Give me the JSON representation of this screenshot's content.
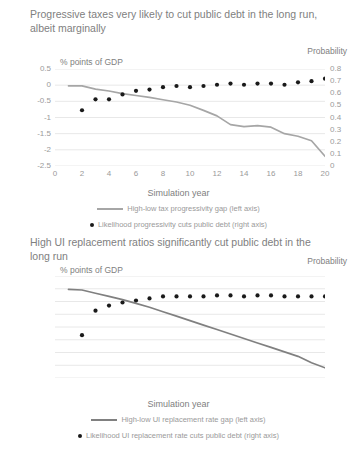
{
  "panels": [
    {
      "title": "Progressive taxes very likely to cut public debt in the long run, albeit marginally",
      "left_axis_caption": "% points of GDP",
      "right_axis_caption": "Probability",
      "xlabel": "Simulation year",
      "legend": [
        {
          "marker": "line",
          "label": "High-low tax progressivity gap (left axis)"
        },
        {
          "marker": "dot",
          "label": "Likelihood progressivity cuts public debt (right axis)"
        }
      ],
      "chart_data": {
        "type": "line",
        "title": "Progressive taxes very likely to cut public debt in the long run, albeit marginally",
        "xlabel": "Simulation year",
        "ylabel": "% points of GDP",
        "y2label": "Probability",
        "xlim": [
          0,
          20
        ],
        "ylim": [
          -2.5,
          0.5
        ],
        "y2lim": [
          0,
          0.8
        ],
        "xticks": [
          0,
          2,
          4,
          6,
          8,
          10,
          12,
          14,
          16,
          18,
          20
        ],
        "yticks": [
          0.5,
          0,
          -0.5,
          -1,
          -1.5,
          -2,
          -2.5
        ],
        "y2ticks": [
          0.8,
          0.7,
          0.6,
          0.5,
          0.4,
          0.3,
          0.2,
          0.1,
          0
        ],
        "grid": true,
        "legend_position": "bottom",
        "x": [
          1,
          2,
          3,
          4,
          5,
          6,
          7,
          8,
          9,
          10,
          11,
          12,
          13,
          14,
          15,
          16,
          17,
          18,
          19,
          20
        ],
        "series": [
          {
            "name": "High-low tax progressivity gap (left axis)",
            "type": "line",
            "axis": "left",
            "color": "#a6a6a6",
            "values": [
              -0.02,
              -0.02,
              -0.12,
              -0.18,
              -0.26,
              -0.32,
              -0.38,
              -0.45,
              -0.52,
              -0.62,
              -0.78,
              -0.95,
              -1.22,
              -1.28,
              -1.25,
              -1.3,
              -1.5,
              -1.58,
              -1.72,
              -2.2
            ]
          },
          {
            "name": "Likelihood progressivity cuts public debt (right axis)",
            "type": "scatter",
            "axis": "right",
            "color": "#1a1a1a",
            "values": [
              null,
              0.46,
              0.55,
              0.55,
              0.59,
              0.62,
              0.63,
              0.65,
              0.66,
              0.65,
              0.66,
              0.67,
              0.68,
              0.67,
              0.68,
              0.68,
              0.67,
              0.69,
              0.7,
              0.72
            ]
          }
        ]
      }
    },
    {
      "title": "High UI replacement ratios significantly cut public debt in the long run",
      "left_axis_caption": "% points of GDP",
      "right_axis_caption": "Probability",
      "xlabel": "Simulation year",
      "legend": [
        {
          "marker": "line",
          "label": "High-low UI replacement rate gap (left axis)"
        },
        {
          "marker": "dot",
          "label": "Likelihood UI replacement rate cuts public debt (right axis)"
        }
      ],
      "chart_data": {
        "type": "line",
        "title": "High UI replacement ratios significantly cut public debt in the long run",
        "xlabel": "Simulation year",
        "ylabel": "% points of GDP",
        "y2label": "Probability",
        "xlim": [
          0,
          20
        ],
        "ylim": [
          -7,
          1
        ],
        "y2lim": [
          0,
          1
        ],
        "xticks": [
          0,
          2,
          4,
          6,
          8,
          10,
          12,
          14,
          16,
          18,
          20
        ],
        "yticks": [
          1,
          0,
          -1,
          -2,
          -3,
          -4,
          -5,
          -6,
          -7
        ],
        "y2ticks": [
          1,
          0.8,
          0.6,
          0.4,
          0.2,
          0
        ],
        "grid": true,
        "legend_position": "bottom",
        "x": [
          1,
          2,
          3,
          4,
          5,
          6,
          7,
          8,
          9,
          10,
          11,
          12,
          13,
          14,
          15,
          16,
          17,
          18,
          19,
          20
        ],
        "series": [
          {
            "name": "High-low UI replacement rate gap (left axis)",
            "type": "line",
            "axis": "left",
            "color": "#808080",
            "values": [
              -0.05,
              -0.1,
              -0.35,
              -0.6,
              -0.85,
              -1.15,
              -1.45,
              -1.8,
              -2.15,
              -2.5,
              -2.85,
              -3.2,
              -3.55,
              -3.9,
              -4.25,
              -4.6,
              -4.95,
              -5.3,
              -5.8,
              -6.2
            ]
          },
          {
            "name": "Likelihood UI replacement rate cuts public debt (right axis)",
            "type": "scatter",
            "axis": "right",
            "color": "#1a1a1a",
            "values": [
              null,
              0.42,
              0.66,
              0.71,
              0.74,
              0.76,
              0.78,
              0.8,
              0.8,
              0.8,
              0.8,
              0.81,
              0.81,
              0.8,
              0.81,
              0.81,
              0.8,
              0.8,
              0.8,
              0.8
            ]
          }
        ]
      }
    }
  ]
}
